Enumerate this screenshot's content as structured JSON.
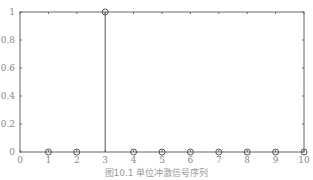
{
  "chart_data": {
    "type": "stem",
    "title": "",
    "xlabel": "",
    "ylabel": "",
    "x": [
      1,
      2,
      3,
      4,
      5,
      6,
      7,
      8,
      9,
      10
    ],
    "values": [
      0,
      0,
      1,
      0,
      0,
      0,
      0,
      0,
      0,
      0
    ],
    "xlim": [
      0,
      10
    ],
    "ylim": [
      0,
      1
    ],
    "xticks": [
      "0",
      "1",
      "2",
      "3",
      "4",
      "5",
      "6",
      "7",
      "8",
      "9",
      "10"
    ],
    "yticks": [
      "0",
      "0.2",
      "0.4",
      "0.6",
      "0.8",
      "1"
    ],
    "grid": false,
    "caption": "图10.1  单位冲激信号序列"
  }
}
